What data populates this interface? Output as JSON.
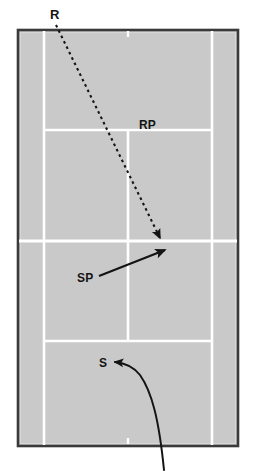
{
  "diagram": {
    "type": "tennis-court-schematic",
    "colors": {
      "court_surface": "#c9c9c9",
      "court_line": "#ffffff",
      "court_border": "#3a3a3a",
      "annotation": "#141414",
      "page_background": "#ffffff"
    },
    "labels": {
      "receiver": "R",
      "receiver_position": "RP",
      "serve_path": "SP",
      "server": "S"
    },
    "annotations": [
      {
        "id": "receiver-return-path",
        "label": "R",
        "style": "dashed-arrow",
        "from": "top-left outside baseline",
        "to": "net center-right"
      },
      {
        "id": "serve-placement-arrow",
        "label": "SP",
        "style": "solid-arrow",
        "from": "deuce court mid",
        "to": "net right of center"
      },
      {
        "id": "server-curve",
        "label": "S",
        "style": "curved-arrow",
        "from": "below baseline",
        "to": "near center baseline area"
      }
    ],
    "court": {
      "outer": {
        "x": 18,
        "y": 30,
        "width": 220,
        "height": 416
      },
      "singles_sideline_left_x": 44,
      "singles_sideline_right_x": 212,
      "service_line_top_y": 130,
      "net_y": 241,
      "service_line_bottom_y": 341,
      "center_service_line_x": 128
    }
  }
}
